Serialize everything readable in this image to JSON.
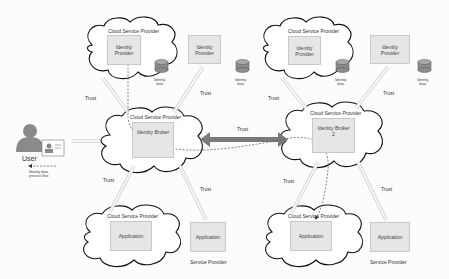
{
  "diagram": {
    "cloud_label": "Cloud Service Provider",
    "trust_label": "Trust",
    "identity_data_label": "Identity\ndata",
    "top": {
      "idp1": {
        "label": "Identity\nProvider",
        "in_cloud": true
      },
      "idp2": {
        "label": "Identity\nProvider",
        "in_cloud": false
      },
      "idp3": {
        "label": "Identity\nProvider",
        "in_cloud": true
      },
      "idp4": {
        "label": "Identity\nProvider",
        "in_cloud": false
      }
    },
    "middle": {
      "broker1": {
        "label": "Identity Broker"
      },
      "broker2": {
        "label": "Identity Broker\n2"
      }
    },
    "bottom": {
      "app1": {
        "label": "Application",
        "in_cloud": true
      },
      "app2": {
        "label": "Application",
        "caption": "Service Provider"
      },
      "app3": {
        "label": "Application",
        "in_cloud": true
      },
      "app4": {
        "label": "Application",
        "caption": "Service Provider"
      }
    },
    "user": {
      "label": "User"
    },
    "legend": {
      "label": "Identity data\nprocess flow"
    },
    "colors": {
      "box_fill": "#e6e6e6",
      "cloud_stroke": "#111111",
      "trust_arrow": "#7a7a7a",
      "trust_arrow_light": "#e4e4e4",
      "cylinder": "#8c8c8c"
    }
  }
}
